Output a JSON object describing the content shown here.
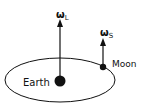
{
  "diagram": {
    "labels": {
      "earth": "Earth",
      "moon": "Moon",
      "omega_l_symbol": "ω",
      "omega_l_sub": "L",
      "omega_s_symbol": "ω",
      "omega_s_sub": "S"
    },
    "colors": {
      "stroke": "#111111",
      "background": "#ffffff"
    }
  }
}
